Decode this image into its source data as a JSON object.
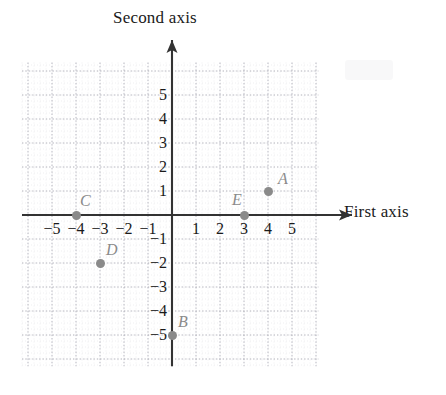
{
  "chart_data": {
    "type": "scatter",
    "title": "",
    "xlabel": "First axis",
    "ylabel": "Second axis",
    "xlim": [
      -6.25,
      6.1
    ],
    "ylim": [
      -6.3,
      6.35
    ],
    "grid": true,
    "minor_grid": true,
    "unit_px": 24,
    "legend": "none",
    "xticks": [
      -5,
      -4,
      -3,
      -2,
      -1,
      1,
      2,
      3,
      4,
      5
    ],
    "yticks": [
      5,
      4,
      3,
      2,
      1,
      -1,
      -2,
      -3,
      -4,
      -5
    ],
    "xtick_labels": [
      "−5",
      "−4",
      "−3",
      "−2",
      "−1",
      "1",
      "2",
      "3",
      "4",
      "5"
    ],
    "ytick_labels": [
      "5",
      "4",
      "3",
      "2",
      "1",
      "−1",
      "−2",
      "−3",
      "−4",
      "−5"
    ],
    "points": [
      {
        "label": "A",
        "x": 4,
        "y": 1,
        "label_dx": 10,
        "label_dy": -20
      },
      {
        "label": "B",
        "x": 0,
        "y": -5,
        "label_dx": 6,
        "label_dy": -21
      },
      {
        "label": "C",
        "x": -4,
        "y": 0,
        "label_dx": 4,
        "label_dy": -22
      },
      {
        "label": "D",
        "x": -3,
        "y": -2,
        "label_dx": 6,
        "label_dy": -21
      },
      {
        "label": "E",
        "x": 3,
        "y": 0,
        "label_dx": -12,
        "label_dy": -23
      }
    ],
    "point_color": "#8a8a8a",
    "axis_color": "#333333",
    "grid_color": "#c9c9d2",
    "text_color": "#1a1a1a"
  },
  "axes": {
    "vertical_title": "Second axis",
    "horizontal_title": "First axis"
  }
}
